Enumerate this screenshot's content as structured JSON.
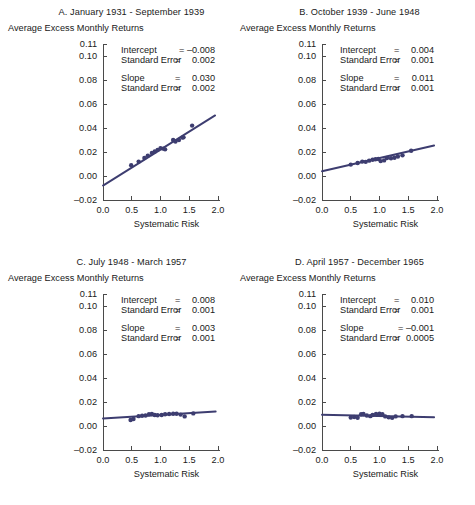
{
  "figure": {
    "axis_labels": {
      "y_axis_label": "Average Excess Monthly Returns",
      "x_axis_label": "Systematic Risk"
    },
    "y_ticks": [
      "0.11",
      "0.10",
      "0.08",
      "0.06",
      "0.04",
      "0.02",
      "0.00",
      "-0.02"
    ],
    "x_ticks": [
      "0.0",
      "0.5",
      "1.0",
      "1.5",
      "2.0"
    ],
    "annotation_labels": {
      "intercept": "Intercept",
      "standard_error": "Standard Error",
      "slope": "Slope",
      "equals": "="
    },
    "line_color": "#3d3d70",
    "marker_color": "#3d3d70"
  },
  "chart_data": [
    {
      "type": "scatter",
      "panel": "A",
      "title": "A. January 1931 - September 1939",
      "xlabel": "Systematic Risk",
      "ylabel": "Average Excess Monthly Returns",
      "xlim": [
        0.0,
        2.0
      ],
      "ylim": [
        -0.02,
        0.11
      ],
      "grid": false,
      "legend": "none",
      "stats": {
        "intercept": "-0.008",
        "intercept_se": "0.002",
        "slope": "0.030",
        "slope_se": "0.002"
      },
      "fit_line": {
        "intercept": -0.008,
        "slope": 0.03,
        "x_start": 0.0,
        "x_end": 1.95
      },
      "x": [
        0.49,
        0.62,
        0.72,
        0.78,
        0.85,
        0.9,
        0.95,
        1.0,
        1.05,
        1.08,
        1.22,
        1.26,
        1.32,
        1.38,
        1.4,
        1.55
      ],
      "y": [
        0.009,
        0.012,
        0.015,
        0.017,
        0.0192,
        0.0205,
        0.0218,
        0.0232,
        0.0228,
        0.0222,
        0.03,
        0.0288,
        0.03,
        0.032,
        0.0322,
        0.042
      ]
    },
    {
      "type": "scatter",
      "panel": "B",
      "title": "B. October 1939 - June 1948",
      "xlabel": "Systematic Risk",
      "ylabel": "Average Excess Monthly Returns",
      "xlim": [
        0.0,
        2.0
      ],
      "ylim": [
        -0.02,
        0.11
      ],
      "grid": false,
      "legend": "none",
      "stats": {
        "intercept": "0.004",
        "intercept_se": "0.001",
        "slope": "0.011",
        "slope_se": "0.001"
      },
      "fit_line": {
        "intercept": 0.004,
        "slope": 0.011,
        "x_start": 0.0,
        "x_end": 1.95
      },
      "x": [
        0.5,
        0.62,
        0.7,
        0.76,
        0.82,
        0.88,
        0.93,
        0.98,
        1.02,
        1.08,
        1.13,
        1.2,
        1.26,
        1.32,
        1.4,
        1.55
      ],
      "y": [
        0.0095,
        0.0108,
        0.012,
        0.0118,
        0.0128,
        0.0135,
        0.014,
        0.0142,
        0.0124,
        0.013,
        0.015,
        0.0148,
        0.0152,
        0.0162,
        0.0172,
        0.021
      ]
    },
    {
      "type": "scatter",
      "panel": "C",
      "title": "C. July 1948 - March 1957",
      "xlabel": "Systematic Risk",
      "ylabel": "Average Excess Monthly Returns",
      "xlim": [
        0.0,
        2.0
      ],
      "ylim": [
        -0.02,
        0.11
      ],
      "grid": false,
      "legend": "none",
      "stats": {
        "intercept": "0.008",
        "intercept_se": "0.001",
        "slope": "0.003",
        "slope_se": "0.001"
      },
      "fit_line": {
        "intercept": 0.0062,
        "slope": 0.003,
        "x_start": 0.0,
        "x_end": 1.96
      },
      "x": [
        0.48,
        0.53,
        0.62,
        0.68,
        0.74,
        0.8,
        0.85,
        0.9,
        0.95,
        1.02,
        1.08,
        1.15,
        1.22,
        1.28,
        1.35,
        1.42,
        1.57
      ],
      "y": [
        0.005,
        0.0058,
        0.0082,
        0.0085,
        0.0088,
        0.0098,
        0.01,
        0.0092,
        0.009,
        0.0092,
        0.0098,
        0.01,
        0.0102,
        0.0102,
        0.0095,
        0.008,
        0.0105
      ]
    },
    {
      "type": "scatter",
      "panel": "D",
      "title": "D. April 1957 - December 1965",
      "xlabel": "Systematic Risk",
      "ylabel": "Average Excess Monthly Returns",
      "xlim": [
        0.0,
        2.0
      ],
      "ylim": [
        -0.02,
        0.11
      ],
      "grid": false,
      "legend": "none",
      "stats": {
        "intercept": "0.010",
        "intercept_se": "0.001",
        "slope": "-0.001",
        "slope_se": "0.0005"
      },
      "fit_line": {
        "intercept": 0.0094,
        "slope": -0.0011,
        "x_start": 0.0,
        "x_end": 1.95
      },
      "x": [
        0.5,
        0.56,
        0.62,
        0.68,
        0.72,
        0.78,
        0.84,
        0.88,
        0.94,
        1.0,
        1.05,
        1.1,
        1.16,
        1.22,
        1.28,
        1.4,
        1.56
      ],
      "y": [
        0.007,
        0.0075,
        0.0068,
        0.0098,
        0.01,
        0.0088,
        0.0082,
        0.0092,
        0.01,
        0.0102,
        0.0098,
        0.008,
        0.0072,
        0.0068,
        0.008,
        0.0082,
        0.0082
      ]
    }
  ]
}
